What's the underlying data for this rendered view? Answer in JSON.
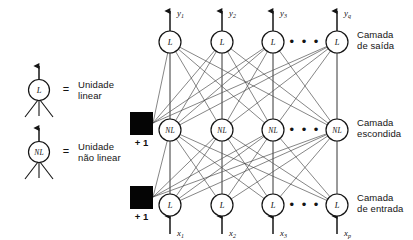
{
  "figure": {
    "kind": "neural-network-diagram",
    "background_color": "#ffffff",
    "ink_color": "#141414"
  },
  "legend": {
    "entries": [
      {
        "symbol": "L",
        "equals": "=",
        "label_line1": "Unidade",
        "label_line2": "linear",
        "unit_type": "linear"
      },
      {
        "symbol": "NL",
        "equals": "=",
        "label_line1": "Unidade",
        "label_line2": "não linear",
        "unit_type": "nao-linear"
      }
    ]
  },
  "layers": [
    {
      "id": "saida",
      "label_line1": "Camada",
      "label_line2": "de saída",
      "unit_symbol": "L",
      "ellipsis": "• • •",
      "signals": [
        "y",
        "y",
        "y",
        "y"
      ],
      "signal_subscripts": [
        "1",
        "2",
        "3",
        "q"
      ],
      "signal_direction": "out"
    },
    {
      "id": "escondida",
      "label_line1": "Camada",
      "label_line2": "escondida",
      "unit_symbol": "NL",
      "ellipsis": "• • •",
      "signals": [],
      "signal_subscripts": [],
      "signal_direction": "none"
    },
    {
      "id": "entrada",
      "label_line1": "Camada",
      "label_line2": "de entrada",
      "unit_symbol": "L",
      "ellipsis": "• • •",
      "signals": [
        "x",
        "x",
        "x",
        "x"
      ],
      "signal_subscripts": [
        "1",
        "2",
        "3",
        "p"
      ],
      "signal_direction": "in"
    }
  ],
  "bias_nodes": [
    {
      "id": "bias-escondida",
      "label": "+ 1"
    },
    {
      "id": "bias-entrada",
      "label": "+ 1"
    }
  ]
}
